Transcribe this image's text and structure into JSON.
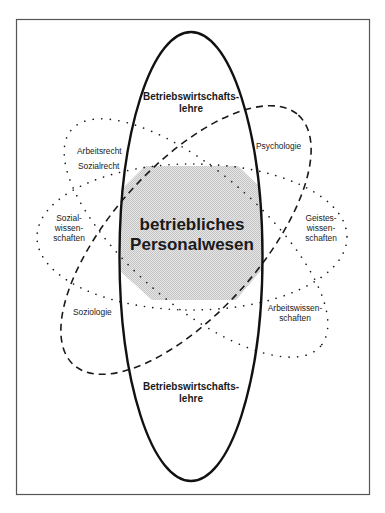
{
  "diagram": {
    "center_label_line1": "betriebliches",
    "center_label_line2": "Personalwesen",
    "main_ellipse": {
      "top_label_line1": "Betriebswirtschafts-",
      "top_label_line2": "lehre",
      "bottom_label_line1": "Betriebswirtschafts-",
      "bottom_label_line2": "lehre"
    },
    "labels": {
      "arbeitsrecht": "Arbeitsrecht",
      "sozialrecht": "Sozialrecht",
      "psychologie": "Psychologie",
      "sozialwissenschaften_1": "Sozial-",
      "sozialwissenschaften_2": "wissen-",
      "sozialwissenschaften_3": "schaften",
      "geisteswissenschaften_1": "Geistes-",
      "geisteswissenschaften_2": "wissen-",
      "geisteswissenschaften_3": "schaften",
      "soziologie": "Soziologie",
      "arbeitswissenschaften_1": "Arbeitswissen-",
      "arbeitswissenschaften_2": "schaften"
    },
    "colors": {
      "line": "#1a1a1a",
      "frame": "#555555",
      "shade": "#d9d9d9"
    }
  }
}
